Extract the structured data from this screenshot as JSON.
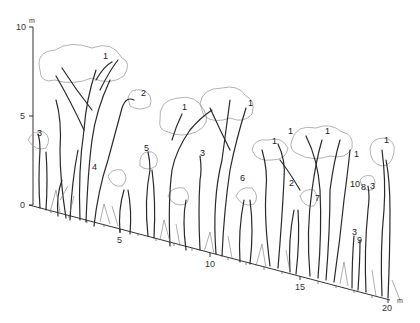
{
  "diagram": {
    "type": "forest-profile",
    "vertical_axis": {
      "unit": "m",
      "ticks": [
        {
          "label": "0",
          "value": 0
        },
        {
          "label": "5",
          "value": 5
        },
        {
          "label": "10",
          "value": 10
        }
      ]
    },
    "horizontal_axis": {
      "unit": "m",
      "ticks": [
        {
          "label": "5",
          "value": 5
        },
        {
          "label": "10",
          "value": 10
        },
        {
          "label": "15",
          "value": 15
        },
        {
          "label": "20",
          "value": 20
        }
      ]
    },
    "species_labels": [
      {
        "label": "1",
        "x": 103,
        "y": 56
      },
      {
        "label": "2",
        "x": 141,
        "y": 93
      },
      {
        "label": "3",
        "x": 37,
        "y": 133
      },
      {
        "label": "4",
        "x": 92,
        "y": 167
      },
      {
        "label": "5",
        "x": 144,
        "y": 148
      },
      {
        "label": "1",
        "x": 182,
        "y": 107
      },
      {
        "label": "1",
        "x": 248,
        "y": 103
      },
      {
        "label": "3",
        "x": 200,
        "y": 153
      },
      {
        "label": "6",
        "x": 240,
        "y": 178
      },
      {
        "label": "1",
        "x": 288,
        "y": 131
      },
      {
        "label": "1",
        "x": 272,
        "y": 141
      },
      {
        "label": "1",
        "x": 325,
        "y": 131
      },
      {
        "label": "1",
        "x": 354,
        "y": 154
      },
      {
        "label": "10",
        "x": 352,
        "y": 184
      },
      {
        "label": "8",
        "x": 362,
        "y": 187
      },
      {
        "label": "3",
        "x": 370,
        "y": 186
      },
      {
        "label": "1",
        "x": 384,
        "y": 140
      },
      {
        "label": "7",
        "x": 315,
        "y": 198
      },
      {
        "label": "2",
        "x": 289,
        "y": 183
      },
      {
        "label": "3",
        "x": 352,
        "y": 232
      },
      {
        "label": "9",
        "x": 357,
        "y": 240
      }
    ],
    "colors": {
      "ink": "#2a2a2a",
      "background": "#ffffff",
      "crown_outline": "#9a9a9a"
    }
  }
}
